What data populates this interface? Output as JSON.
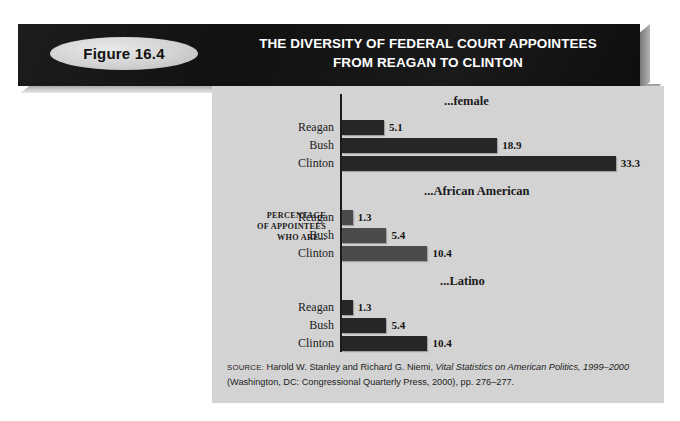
{
  "figure": {
    "badge_label": "Figure 16.4",
    "title_line1": "THE DIVERSITY OF FEDERAL COURT APPOINTEES",
    "title_line2": "FROM REAGAN TO CLINTON"
  },
  "axis_caption": {
    "line1": "PERCENTAGE",
    "line2": "OF APPOINTEES",
    "line3": "WHO ARE..."
  },
  "source": {
    "label": "SOURCE:",
    "text_before_italic": " Harold W. Stanley and Richard G. Niemi, ",
    "italic_title": "Vital Statistics on American Politics, 1999–2000",
    "text_after_italic": " (Washington, DC: Congressional Quarterly Press, 2000), pp. 276–277."
  },
  "colors": {
    "panel_background": "#d3d3d3",
    "banner_background": "#161616",
    "bar_dark": "#272727",
    "bar_light": "#4b4b4b",
    "badge_fill": "#d2d2d2",
    "title_text": "#ffffff",
    "axis_line": "#1b1b1b"
  },
  "chart_data": {
    "type": "bar",
    "orientation": "horizontal",
    "title": "THE DIVERSITY OF FEDERAL COURT APPOINTEES FROM REAGAN TO CLINTON",
    "xlabel": "",
    "ylabel": "PERCENTAGE OF APPOINTEES WHO ARE...",
    "xlim": [
      0,
      33.3
    ],
    "grid": false,
    "legend": false,
    "categories": [
      "Reagan",
      "Bush",
      "Clinton"
    ],
    "groups": [
      {
        "name": "...female",
        "shade": "dark",
        "values": [
          5.1,
          18.9,
          33.3
        ],
        "labels": [
          "5.1",
          "18.9",
          "33.3"
        ]
      },
      {
        "name": "...African American",
        "shade": "light",
        "values": [
          1.3,
          5.4,
          10.4
        ],
        "labels": [
          "1.3",
          "5.4",
          "10.4"
        ]
      },
      {
        "name": "...Latino",
        "shade": "dark",
        "values": [
          1.3,
          5.4,
          10.4
        ],
        "labels": [
          "1.3",
          "5.4",
          "10.4"
        ]
      }
    ]
  }
}
